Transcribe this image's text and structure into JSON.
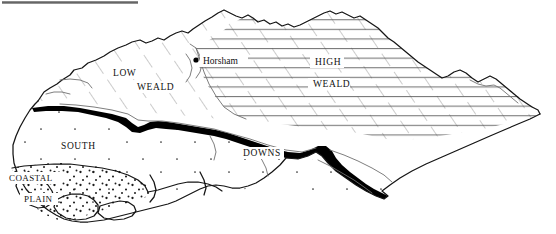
{
  "figure": {
    "kind": "physiographic-sketch-map",
    "region": "Sussex",
    "background_color": "#ffffff",
    "ink_color": "#111111",
    "top_rule": {
      "visible": true,
      "label": "top-rule-artifact"
    }
  },
  "regions": [
    {
      "id": "low-weald",
      "label_line1": "LOW",
      "label_line2": "WEALD",
      "pattern": "diagonal-dashed-hatch",
      "pattern_color": "#8a8a8a",
      "label_x1": 113,
      "label_y1": 76,
      "label_x2": 137,
      "label_y2": 90
    },
    {
      "id": "high-weald",
      "label_line1": "HIGH",
      "label_line2": "WEALD",
      "pattern": "horizontal-lines",
      "pattern_color": "#5a5a5a",
      "label_x1": 315,
      "label_y1": 65,
      "label_x2": 313,
      "label_y2": 87
    },
    {
      "id": "south-downs",
      "label_line1": "SOUTH",
      "label_line2": "DOWNS",
      "pattern": "sparse-stipple",
      "pattern_color": "#333333",
      "label_x1": 61,
      "label_y1": 149,
      "label_x2": 243,
      "label_y2": 156
    },
    {
      "id": "coastal-plain",
      "label_line1": "COASTAL",
      "label_line2": "PLAIN",
      "pattern": "dense-stipple",
      "pattern_color": "#222222",
      "label_x1": 9,
      "label_y1": 181,
      "label_x2": 24,
      "label_y2": 202
    }
  ],
  "escarpment": {
    "id": "chalk-escarpment",
    "style": "solid-black-band",
    "color": "#000000"
  },
  "places": [
    {
      "id": "horsham",
      "name": "Horsham",
      "marker": "filled-dot",
      "marker_x": 196,
      "marker_y": 60,
      "label_x": 203,
      "label_y": 64
    }
  ]
}
